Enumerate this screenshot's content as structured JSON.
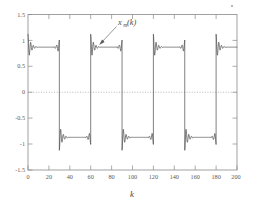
{
  "chart_data": {
    "type": "line",
    "title": "",
    "xlabel": "k",
    "ylabel": "",
    "xlim": [
      0,
      200
    ],
    "ylim": [
      -1.5,
      1.5
    ],
    "xticks": [
      0,
      20,
      40,
      60,
      80,
      100,
      120,
      140,
      160,
      180,
      200
    ],
    "xticklabels": [
      "0",
      "20",
      "40",
      "60",
      "80",
      "100",
      "120",
      "140",
      "160",
      "180",
      "200"
    ],
    "yticks": [
      -1.5,
      -1,
      -0.5,
      0,
      0.5,
      1,
      1.5
    ],
    "yticklabels": [
      "-1.5",
      "-1",
      "-0.5",
      "0",
      "0.5",
      "1",
      "1.5"
    ],
    "grid": false,
    "legend": null,
    "zero_reference_line": {
      "value": 0,
      "style": "dotted",
      "color": "#9a9a9a"
    },
    "annotations": [
      {
        "text": "x",
        "subscript": "m",
        "suffix": "(k)",
        "full_text": "x_m(k)",
        "target_x": 62,
        "target_y": 0.88,
        "label_x": 78,
        "label_y": 1.25
      }
    ],
    "series": [
      {
        "name": "x_m(k)",
        "color": "#4f4f4f",
        "description": "Band-limited (truncated Fourier) square wave exhibiting Gibbs ringing at each discontinuity",
        "waveform": {
          "shape": "square",
          "period": 60,
          "plateau_high": 0.87,
          "plateau_low": -0.87,
          "overshoot_high": 1.12,
          "overshoot_low": -1.12,
          "transitions": [
            0,
            30,
            60,
            90,
            120,
            150,
            180
          ],
          "ringing_cycles": 7,
          "ringing_span": 9
        },
        "key_points": [
          {
            "k": 0,
            "value": 0.87
          },
          {
            "k": 2,
            "value": 1.1
          },
          {
            "k": 10,
            "value": 0.87
          },
          {
            "k": 29,
            "value": 0.87
          },
          {
            "k": 30,
            "value": -0.87
          },
          {
            "k": 32,
            "value": -1.12
          },
          {
            "k": 40,
            "value": -0.87
          },
          {
            "k": 59,
            "value": -0.87
          },
          {
            "k": 60,
            "value": 0.87
          },
          {
            "k": 62,
            "value": 1.12
          },
          {
            "k": 70,
            "value": 0.87
          },
          {
            "k": 89,
            "value": 0.87
          },
          {
            "k": 90,
            "value": -0.87
          },
          {
            "k": 92,
            "value": -1.12
          },
          {
            "k": 100,
            "value": -0.87
          },
          {
            "k": 119,
            "value": -0.87
          },
          {
            "k": 120,
            "value": 0.87
          },
          {
            "k": 122,
            "value": 1.12
          },
          {
            "k": 130,
            "value": 0.87
          },
          {
            "k": 149,
            "value": 0.87
          },
          {
            "k": 150,
            "value": -0.87
          },
          {
            "k": 152,
            "value": -1.12
          },
          {
            "k": 160,
            "value": -0.87
          },
          {
            "k": 179,
            "value": -0.87
          },
          {
            "k": 180,
            "value": 0.87
          },
          {
            "k": 182,
            "value": 1.12
          },
          {
            "k": 190,
            "value": 0.87
          },
          {
            "k": 200,
            "value": 0.85
          }
        ]
      }
    ]
  },
  "figure": {
    "axis_color": "#8a8a8a",
    "trace_color": "#4f4f4f",
    "background": "#ffffff"
  }
}
